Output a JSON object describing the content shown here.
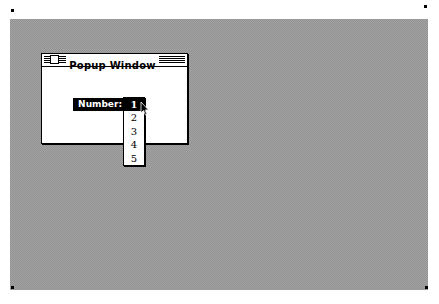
{
  "window": {
    "title": "Popup Window"
  },
  "popup": {
    "label": "Number:",
    "selected_value": "1",
    "items": [
      {
        "label": "1",
        "selected": true
      },
      {
        "label": "2",
        "selected": false
      },
      {
        "label": "3",
        "selected": false
      },
      {
        "label": "4",
        "selected": false
      },
      {
        "label": "5",
        "selected": false
      }
    ]
  },
  "colors": {
    "desktop": "#a3a3a3",
    "highlight": "#000000",
    "window_bg": "#ffffff"
  },
  "icons": {
    "close_box": "close-box-icon",
    "cursor": "arrow-cursor-icon"
  }
}
